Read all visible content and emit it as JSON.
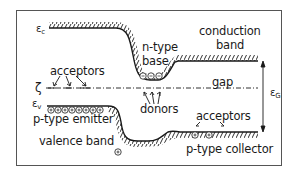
{
  "diagram": {
    "type": "energy-band-diagram",
    "colors": {
      "ink": "#1a1a1a",
      "frame": "#555555",
      "background": "#ffffff"
    },
    "labels": {
      "ec_symbol": "ε",
      "ec_sub": "c",
      "ev_symbol": "ε",
      "ev_sub": "v",
      "fermi_symbol": "ζ",
      "eg_symbol": "ε",
      "eg_sub": "G",
      "conduction_band_line1": "conduction",
      "conduction_band_line2": "band",
      "valence_band": "valence  band",
      "gap": "gap",
      "n_type_line1": "n-type",
      "n_type_line2": "base",
      "p_type_emitter": "p-type emitter",
      "p_type_collector": "p-type  collector",
      "acceptors_left": "acceptors",
      "acceptors_right": "acceptors",
      "donors": "donors"
    },
    "regions": [
      {
        "name": "p-type emitter",
        "carrier_symbol": "⊕",
        "count": 8
      },
      {
        "name": "n-type base",
        "carrier_symbol": "⊖",
        "count": 3
      },
      {
        "name": "p-type collector",
        "carrier_symbol": "⊕",
        "count": 2
      }
    ]
  }
}
